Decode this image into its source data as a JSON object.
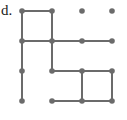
{
  "figure": {
    "label": "d.",
    "caption_text": "d.",
    "type": "lattice-graph-diagram",
    "width_px": 127,
    "height_px": 120,
    "background_color": "#ffffff"
  },
  "style": {
    "vertex_color": "#6b6b6b",
    "edge_color": "#6b6b6b",
    "label_color": "#1a1a1a",
    "vertex_radius_px": 2.8,
    "edge_width_px": 2
  },
  "graph": {
    "rows": 4,
    "cols": 4,
    "column_x": [
      22,
      52,
      82,
      112
    ],
    "row_y": [
      11,
      41,
      71,
      101
    ],
    "vertices": [
      {
        "id": "r1c1",
        "row": 1,
        "col": 1,
        "x": 22,
        "y": 11
      },
      {
        "id": "r1c2",
        "row": 1,
        "col": 2,
        "x": 52,
        "y": 11
      },
      {
        "id": "r1c3",
        "row": 1,
        "col": 3,
        "x": 82,
        "y": 11
      },
      {
        "id": "r1c4",
        "row": 1,
        "col": 4,
        "x": 112,
        "y": 11
      },
      {
        "id": "r2c1",
        "row": 2,
        "col": 1,
        "x": 22,
        "y": 41
      },
      {
        "id": "r2c2",
        "row": 2,
        "col": 2,
        "x": 52,
        "y": 41
      },
      {
        "id": "r2c3",
        "row": 2,
        "col": 3,
        "x": 82,
        "y": 41
      },
      {
        "id": "r2c4",
        "row": 2,
        "col": 4,
        "x": 112,
        "y": 41
      },
      {
        "id": "r3c1",
        "row": 3,
        "col": 1,
        "x": 22,
        "y": 71
      },
      {
        "id": "r3c2",
        "row": 3,
        "col": 2,
        "x": 52,
        "y": 71
      },
      {
        "id": "r3c3",
        "row": 3,
        "col": 3,
        "x": 82,
        "y": 71
      },
      {
        "id": "r3c4",
        "row": 3,
        "col": 4,
        "x": 112,
        "y": 71
      },
      {
        "id": "r4c1",
        "row": 4,
        "col": 1,
        "x": 22,
        "y": 101
      },
      {
        "id": "r4c2",
        "row": 4,
        "col": 2,
        "x": 52,
        "y": 101
      },
      {
        "id": "r4c3",
        "row": 4,
        "col": 3,
        "x": 82,
        "y": 101
      },
      {
        "id": "r4c4",
        "row": 4,
        "col": 4,
        "x": 112,
        "y": 101
      }
    ],
    "edges": [
      {
        "id": "e-r1c1-r1c2",
        "orientation": "horizontal",
        "x1": 22,
        "y1": 11,
        "x2": 52,
        "y2": 11
      },
      {
        "id": "e-r2c1-r2c2",
        "orientation": "horizontal",
        "x1": 22,
        "y1": 41,
        "x2": 52,
        "y2": 41
      },
      {
        "id": "e-r2c2-r2c3",
        "orientation": "horizontal",
        "x1": 52,
        "y1": 41,
        "x2": 82,
        "y2": 41
      },
      {
        "id": "e-r2c3-r2c4",
        "orientation": "horizontal",
        "x1": 82,
        "y1": 41,
        "x2": 112,
        "y2": 41
      },
      {
        "id": "e-r3c2-r3c3",
        "orientation": "horizontal",
        "x1": 52,
        "y1": 71,
        "x2": 82,
        "y2": 71
      },
      {
        "id": "e-r3c3-r3c4",
        "orientation": "horizontal",
        "x1": 82,
        "y1": 71,
        "x2": 112,
        "y2": 71
      },
      {
        "id": "e-r4c2-r4c3",
        "orientation": "horizontal",
        "x1": 52,
        "y1": 101,
        "x2": 82,
        "y2": 101
      },
      {
        "id": "e-r4c3-r4c4",
        "orientation": "horizontal",
        "x1": 82,
        "y1": 101,
        "x2": 112,
        "y2": 101
      },
      {
        "id": "e-r1c1-r2c1",
        "orientation": "vertical",
        "x1": 22,
        "y1": 11,
        "x2": 22,
        "y2": 41
      },
      {
        "id": "e-r2c1-r3c1",
        "orientation": "vertical",
        "x1": 22,
        "y1": 41,
        "x2": 22,
        "y2": 71
      },
      {
        "id": "e-r3c1-r4c1",
        "orientation": "vertical",
        "x1": 22,
        "y1": 71,
        "x2": 22,
        "y2": 101
      },
      {
        "id": "e-r1c2-r2c2",
        "orientation": "vertical",
        "x1": 52,
        "y1": 11,
        "x2": 52,
        "y2": 41
      },
      {
        "id": "e-r2c2-r3c2",
        "orientation": "vertical",
        "x1": 52,
        "y1": 41,
        "x2": 52,
        "y2": 71
      },
      {
        "id": "e-r3c3-r4c3",
        "orientation": "vertical",
        "x1": 82,
        "y1": 71,
        "x2": 82,
        "y2": 101
      },
      {
        "id": "e-r3c4-r4c4",
        "orientation": "vertical",
        "x1": 112,
        "y1": 71,
        "x2": 112,
        "y2": 101
      }
    ]
  }
}
